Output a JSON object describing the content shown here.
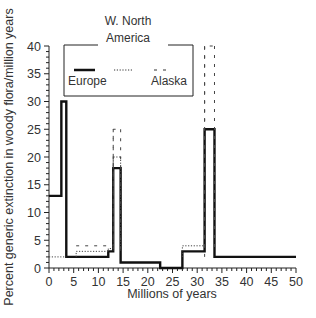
{
  "chart_data": {
    "type": "line",
    "subtype": "step",
    "title": "",
    "xlabel": "Millions of years",
    "ylabel": "Percent generic extinction in woody flora/million years",
    "xlim": [
      0,
      50
    ],
    "ylim": [
      0,
      40
    ],
    "xticks": [
      0,
      5,
      10,
      15,
      20,
      25,
      30,
      35,
      40,
      45,
      50
    ],
    "yticks": [
      0,
      5,
      10,
      15,
      20,
      25,
      30,
      35,
      40
    ],
    "grid": false,
    "legend": {
      "position": "upper-left-inside",
      "title": "W. North America",
      "entries": [
        "Europe",
        "W. North America",
        "Alaska"
      ]
    },
    "series": [
      {
        "name": "Europe",
        "style": "solid",
        "steps": [
          {
            "x0": 0,
            "x1": 2.5,
            "y": 13
          },
          {
            "x0": 2.5,
            "x1": 3.5,
            "y": 30
          },
          {
            "x0": 3.5,
            "x1": 12,
            "y": 2
          },
          {
            "x0": 12,
            "x1": 13,
            "y": 3
          },
          {
            "x0": 13,
            "x1": 14.5,
            "y": 18
          },
          {
            "x0": 14.5,
            "x1": 22.5,
            "y": 1
          },
          {
            "x0": 22.5,
            "x1": 27,
            "y": 0
          },
          {
            "x0": 27,
            "x1": 31.5,
            "y": 3
          },
          {
            "x0": 31.5,
            "x1": 33.5,
            "y": 25
          },
          {
            "x0": 33.5,
            "x1": 50,
            "y": 2
          }
        ]
      },
      {
        "name": "W. North America",
        "style": "dotted",
        "steps": [
          {
            "x0": 0,
            "x1": 3.5,
            "y": 2
          },
          {
            "x0": 5.5,
            "x1": 12,
            "y": 3
          },
          {
            "x0": 12,
            "x1": 13,
            "y": 3.5
          },
          {
            "x0": 13,
            "x1": 14.5,
            "y": 20
          },
          {
            "x0": 27,
            "x1": 31.5,
            "y": 4
          }
        ]
      },
      {
        "name": "Alaska",
        "style": "dashed",
        "steps": [
          {
            "x0": 5.5,
            "x1": 13,
            "y": 4
          },
          {
            "x0": 13,
            "x1": 14.5,
            "y": 25
          },
          {
            "x0": 31.5,
            "x1": 33.5,
            "y": 40
          }
        ]
      }
    ]
  },
  "legend": {
    "title_line1": "W. North",
    "title_line2": "America",
    "europe": "Europe",
    "alaska": "Alaska"
  },
  "colors": {
    "line": "#111111",
    "text": "#333333",
    "background": "#ffffff"
  }
}
